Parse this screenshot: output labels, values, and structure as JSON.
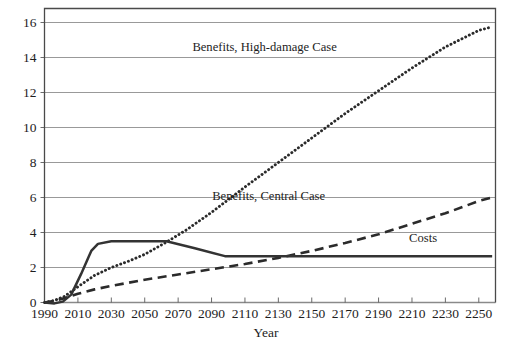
{
  "chart_data": {
    "type": "line",
    "title": "",
    "xlabel": "Year",
    "ylabel": "",
    "xlim": [
      1990,
      2260
    ],
    "ylim": [
      0,
      16
    ],
    "grid": true,
    "legend_position": "inline-annotations",
    "x_ticks": [
      1990,
      2010,
      2030,
      2050,
      2070,
      2090,
      2110,
      2130,
      2150,
      2170,
      2190,
      2210,
      2230,
      2250
    ],
    "y_ticks": [
      0,
      2,
      4,
      6,
      8,
      10,
      12,
      14,
      16
    ],
    "series": [
      {
        "name": "Benefits, High-damage Case",
        "style": "dotted",
        "color": "#2b2b2b",
        "x": [
          1990,
          1996,
          2002,
          2010,
          2020,
          2030,
          2040,
          2050,
          2063,
          2075,
          2090,
          2110,
          2130,
          2150,
          2170,
          2190,
          2210,
          2230,
          2250,
          2258
        ],
        "y": [
          0.0,
          0.12,
          0.35,
          0.9,
          1.55,
          2.0,
          2.35,
          2.75,
          3.45,
          4.15,
          5.15,
          6.6,
          8.0,
          9.4,
          10.8,
          12.1,
          13.4,
          14.6,
          15.55,
          15.75
        ]
      },
      {
        "name": "Benefits, Central Case",
        "style": "dashed",
        "color": "#2b2b2b",
        "x": [
          1990,
          1996,
          2002,
          2010,
          2020,
          2030,
          2050,
          2070,
          2090,
          2110,
          2130,
          2150,
          2170,
          2190,
          2210,
          2230,
          2250,
          2258
        ],
        "y": [
          0.0,
          0.1,
          0.25,
          0.5,
          0.75,
          0.95,
          1.3,
          1.6,
          1.9,
          2.2,
          2.55,
          2.95,
          3.4,
          3.9,
          4.5,
          5.1,
          5.8,
          6.0
        ]
      },
      {
        "name": "Costs",
        "style": "solid",
        "color": "#333333",
        "x": [
          1990,
          1996,
          2001,
          2006,
          2012,
          2018,
          2022,
          2030,
          2045,
          2063,
          2080,
          2098,
          2120,
          2160,
          2200,
          2240,
          2258
        ],
        "y": [
          0.0,
          -0.05,
          0.05,
          0.45,
          1.65,
          2.95,
          3.35,
          3.5,
          3.5,
          3.5,
          3.1,
          2.65,
          2.65,
          2.65,
          2.65,
          2.65,
          2.65
        ]
      }
    ],
    "annotations": [
      {
        "text": "Benefits, High-damage Case",
        "x": 2165,
        "y": 14.35,
        "anchor": "end"
      },
      {
        "text": "Benefits, Central Case",
        "x": 2158,
        "y": 5.85,
        "anchor": "end"
      },
      {
        "text": "Costs",
        "x": 2225,
        "y": 3.45,
        "anchor": "end"
      }
    ]
  }
}
